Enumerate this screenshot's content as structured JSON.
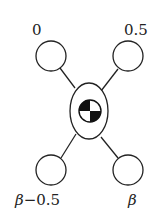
{
  "diagram": {
    "type": "mass-spring-node",
    "center": {
      "symbol": "center-of-mass-icon",
      "description": "ellipse containing center-of-mass symbol"
    },
    "nodes": [
      {
        "id": "top-left",
        "label": "0"
      },
      {
        "id": "top-right",
        "label": "0.5"
      },
      {
        "id": "bottom-left",
        "label_symbol": "β",
        "label_rest": "−0.5"
      },
      {
        "id": "bottom-right",
        "label_symbol": "β",
        "label_rest": ""
      }
    ]
  },
  "colors": {
    "stroke": "#222222",
    "fill": "#ffffff",
    "dark": "#111111"
  }
}
